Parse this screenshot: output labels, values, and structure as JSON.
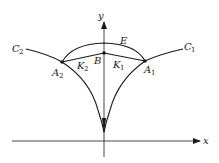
{
  "diagram": {
    "axes": {
      "x_label": "x",
      "y_label": "y"
    },
    "curves": [
      {
        "id": "C1",
        "label": "C",
        "subscript": "1"
      },
      {
        "id": "C2",
        "label": "C",
        "subscript": "2"
      }
    ],
    "points": [
      {
        "id": "A1",
        "label": "A",
        "subscript": "1"
      },
      {
        "id": "A2",
        "label": "A",
        "subscript": "2"
      },
      {
        "id": "B",
        "label": "B",
        "subscript": ""
      }
    ],
    "segments": [
      {
        "id": "K1",
        "label": "K",
        "subscript": "1"
      },
      {
        "id": "K2",
        "label": "K",
        "subscript": "2"
      }
    ],
    "arc": {
      "id": "E",
      "label": "E"
    }
  }
}
